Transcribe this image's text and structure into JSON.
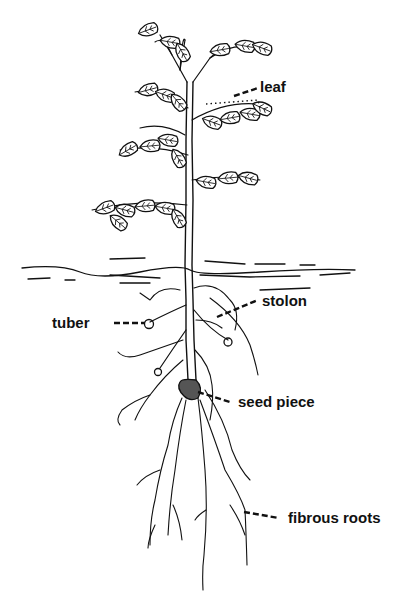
{
  "diagram": {
    "colors": {
      "ink": "#111111",
      "background": "#ffffff"
    },
    "labels": {
      "leaf": "leaf",
      "stolon": "stolon",
      "tuber": "tuber",
      "seed_piece": "seed piece",
      "fibrous_roots": "fibrous roots"
    }
  }
}
